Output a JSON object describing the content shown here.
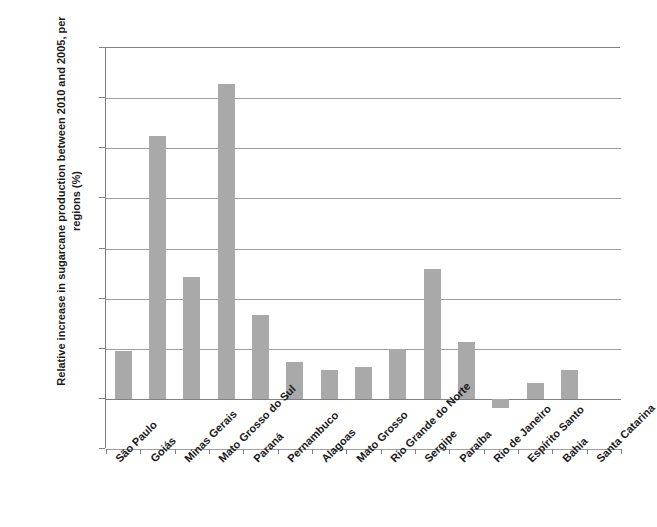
{
  "chart_data": {
    "type": "bar",
    "title": "",
    "subtitle": "",
    "xlabel": "",
    "ylabel": "Relative increase in sugarcane production between 2010 and 2005, per regions (%)",
    "ylim": [
      -50,
      350
    ],
    "ytick_step": 50,
    "grid": true,
    "legend": "none",
    "bar_color": "#a9a9a9",
    "axis_color": "#808080",
    "gridline_color": "#9e9e9e",
    "ytick_labels": [
      "350%",
      "300%",
      "250%",
      "200%",
      "150%",
      "100%",
      "50%",
      "0%",
      "-50%"
    ],
    "ytick_values": [
      350,
      300,
      250,
      200,
      150,
      100,
      50,
      0,
      -50
    ],
    "categories": [
      "São Paulo",
      "Goiás",
      "Minas Gerais",
      "Mato Grosso do Sul",
      "Paraná",
      "Pernambuco",
      "Alagoas",
      "Mato Grosso",
      "Rio Grande do Norte",
      "Sergipe",
      "Paraíba",
      "Rio de Janeiro",
      "Espírito Santo",
      "Bahia",
      "Santa Catarina"
    ],
    "values": [
      48,
      262,
      122,
      314,
      84,
      37,
      29,
      32,
      50,
      130,
      57,
      -9,
      16,
      29,
      0
    ]
  }
}
